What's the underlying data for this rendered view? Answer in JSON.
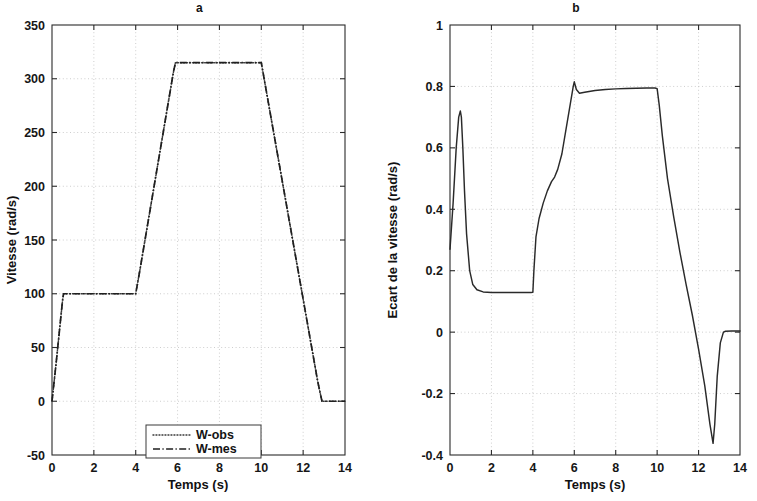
{
  "figure": {
    "background": "#ffffff",
    "line_color": "#2a2a2a"
  },
  "panels": {
    "a": {
      "title": "a",
      "xlabel": "Temps (s)",
      "ylabel": "Vitesse (rad/s)",
      "xticklabels": [
        "0",
        "2",
        "4",
        "6",
        "8",
        "10",
        "12",
        "14"
      ],
      "yticklabels": [
        "-50",
        "0",
        "50",
        "100",
        "150",
        "200",
        "250",
        "300",
        "350"
      ],
      "legend": {
        "items": [
          {
            "label": "W-obs",
            "style": "dotted"
          },
          {
            "label": "W-mes",
            "style": "dash-dot"
          }
        ]
      }
    },
    "b": {
      "title": "b",
      "xlabel": "Temps (s)",
      "ylabel": "Ecart de la vitesse (rad/s)",
      "xticklabels": [
        "0",
        "2",
        "4",
        "6",
        "8",
        "10",
        "12",
        "14"
      ],
      "yticklabels": [
        "-0.4",
        "-0.2",
        "0",
        "0.2",
        "0.4",
        "0.6",
        "0.8",
        "1"
      ]
    }
  },
  "chart_data": [
    {
      "id": "panel-a",
      "type": "line",
      "title": "a",
      "xlabel": "Temps (s)",
      "ylabel": "Vitesse (rad/s)",
      "xlim": [
        0,
        14
      ],
      "ylim": [
        -50,
        350
      ],
      "xticks": [
        0,
        2,
        4,
        6,
        8,
        10,
        12,
        14
      ],
      "yticks": [
        -50,
        0,
        50,
        100,
        150,
        200,
        250,
        300,
        350
      ],
      "grid": true,
      "legend_position": "lower center",
      "series": [
        {
          "name": "W-obs",
          "style": "dotted",
          "x": [
            0,
            0.1,
            0.2,
            0.3,
            0.4,
            0.5,
            0.55,
            1,
            2,
            3,
            4,
            4.2,
            4.6,
            5,
            5.4,
            5.8,
            5.9,
            6.5,
            7.5,
            8.5,
            9.5,
            10,
            10.3,
            10.8,
            11.3,
            11.8,
            12.3,
            12.7,
            12.9,
            13.2,
            14
          ],
          "y": [
            0,
            18,
            36,
            55,
            74,
            93,
            100,
            100,
            100,
            100,
            100,
            122,
            168,
            214,
            260,
            306,
            315,
            315,
            315,
            315,
            315,
            315,
            282,
            227,
            172,
            117,
            62,
            18,
            0,
            0,
            0
          ]
        },
        {
          "name": "W-mes",
          "style": "dash-dot",
          "x": [
            0,
            0.1,
            0.2,
            0.3,
            0.4,
            0.5,
            0.55,
            1,
            2,
            3,
            4,
            4.2,
            4.6,
            5,
            5.4,
            5.8,
            5.9,
            6.5,
            7.5,
            8.5,
            9.5,
            10,
            10.3,
            10.8,
            11.3,
            11.8,
            12.3,
            12.7,
            12.9,
            13.2,
            14
          ],
          "y": [
            0,
            18,
            36,
            55,
            74,
            93,
            100,
            100,
            100,
            100,
            100,
            122,
            168,
            214,
            260,
            306,
            315,
            315,
            315,
            315,
            315,
            315,
            282,
            227,
            172,
            117,
            62,
            18,
            0,
            0,
            0
          ]
        }
      ]
    },
    {
      "id": "panel-b",
      "type": "line",
      "title": "b",
      "xlabel": "Temps (s)",
      "ylabel": "Ecart de la vitesse (rad/s)",
      "xlim": [
        0,
        14
      ],
      "ylim": [
        -0.4,
        1
      ],
      "xticks": [
        0,
        2,
        4,
        6,
        8,
        10,
        12,
        14
      ],
      "yticks": [
        -0.4,
        -0.2,
        0,
        0.2,
        0.4,
        0.6,
        0.8,
        1
      ],
      "grid": true,
      "series": [
        {
          "name": "Ecart",
          "style": "solid",
          "x": [
            0,
            0.15,
            0.3,
            0.42,
            0.5,
            0.55,
            0.62,
            0.7,
            0.8,
            0.95,
            1.1,
            1.3,
            1.6,
            2,
            2.5,
            3,
            3.5,
            3.9,
            4.0,
            4.05,
            4.15,
            4.3,
            4.5,
            4.7,
            4.9,
            5.05,
            5.2,
            5.4,
            5.6,
            5.8,
            5.95,
            6.0,
            6.1,
            6.25,
            6.5,
            7,
            7.5,
            8,
            8.5,
            9,
            9.5,
            9.9,
            10.0,
            10.1,
            10.25,
            10.5,
            10.8,
            11.1,
            11.4,
            11.7,
            12.0,
            12.3,
            12.55,
            12.7,
            12.78,
            12.9,
            13.05,
            13.2,
            13.3,
            13.6,
            14
          ],
          "y": [
            0.27,
            0.42,
            0.6,
            0.7,
            0.72,
            0.7,
            0.6,
            0.46,
            0.32,
            0.2,
            0.155,
            0.138,
            0.131,
            0.129,
            0.129,
            0.129,
            0.129,
            0.129,
            0.13,
            0.2,
            0.31,
            0.37,
            0.42,
            0.46,
            0.49,
            0.505,
            0.53,
            0.58,
            0.66,
            0.74,
            0.8,
            0.815,
            0.79,
            0.778,
            0.781,
            0.787,
            0.79,
            0.792,
            0.793,
            0.794,
            0.795,
            0.795,
            0.793,
            0.74,
            0.64,
            0.5,
            0.375,
            0.26,
            0.155,
            0.055,
            -0.055,
            -0.175,
            -0.3,
            -0.362,
            -0.3,
            -0.145,
            -0.035,
            0.0,
            0.003,
            0.004,
            0.004
          ]
        }
      ]
    }
  ]
}
